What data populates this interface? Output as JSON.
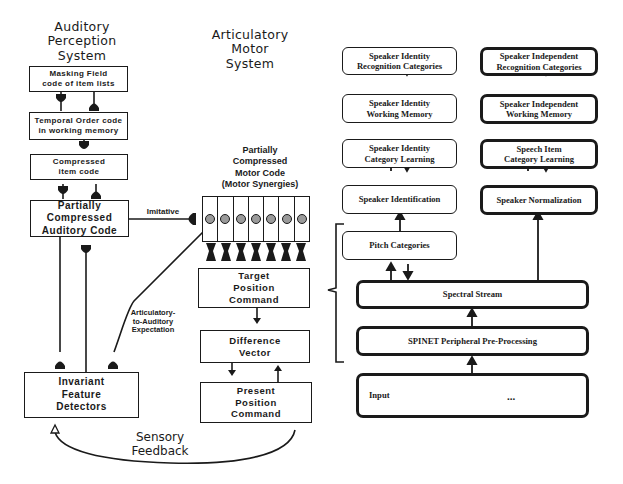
{
  "titles": {
    "auditory": [
      "Auditory",
      "Perception",
      "System"
    ],
    "motor": [
      "Articulatory",
      "Motor",
      "System"
    ]
  },
  "auditory_boxes": {
    "masking_field": [
      "Masking Field",
      "code of item lists"
    ],
    "temporal_order": [
      "Temporal Order code",
      "in working memory"
    ],
    "compressed_item": [
      "Compressed",
      "item code"
    ],
    "partial_auditory": [
      "Partially",
      "Compressed",
      "Auditory Code"
    ],
    "invariant_feature": [
      "Invariant",
      "Feature",
      "Detectors"
    ]
  },
  "motor_boxes": {
    "partial_motor_label": [
      "Partially",
      "Compressed",
      "Motor Code",
      "(Motor Synergies)"
    ],
    "synergy_cells": 7,
    "target_position": [
      "Target",
      "Position",
      "Command"
    ],
    "difference_vector": [
      "Difference",
      "Vector"
    ],
    "present_position": [
      "Present",
      "Position",
      "Command"
    ]
  },
  "connection_labels": {
    "imitative": "Imitative",
    "art_to_aud": [
      "Articulatory-",
      "to-Auditory",
      "Expectation"
    ],
    "sensory_feedback": [
      "Sensory",
      "Feedback"
    ]
  },
  "right_panel": {
    "speaker_identity_recognition": [
      "Speaker Identity",
      "Recognition Categories"
    ],
    "speaker_identity_wm": [
      "Speaker Identity",
      "Working Memory"
    ],
    "speaker_identity_learning": [
      "Speaker Identity",
      "Category Learning"
    ],
    "speaker_identification": "Speaker Identification",
    "speaker_independent_recognition": [
      "Speaker Independent",
      "Recognition Categories"
    ],
    "speaker_independent_wm": [
      "Speaker Independent",
      "Working Memory"
    ],
    "speech_item_learning": [
      "Speech Item",
      "Category Learning"
    ],
    "speaker_normalization": "Speaker Normalization",
    "pitch_categories": "Pitch Categories",
    "spectral_stream": "Spectral Stream",
    "spinet": "SPINET Peripheral Pre-Processing",
    "input_label": "Input",
    "input_ellipsis": "..."
  },
  "colors": {
    "ink": "#1a1a1a",
    "background": "#ffffff",
    "synergy_fill": "#9a9a9a"
  }
}
